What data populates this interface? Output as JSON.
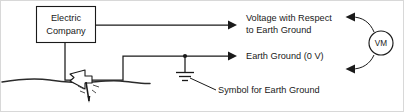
{
  "figure": {
    "source_box": {
      "line1": "Electric",
      "line2": "Company"
    },
    "labels": {
      "voltage_line1": "Voltage with Respect",
      "voltage_line2": "to Earth Ground",
      "earth_ground": "Earth Ground (0 V)",
      "symbol_caption": "Symbol for Earth Ground"
    },
    "meter": {
      "label": "VM"
    },
    "colors": {
      "ink": "#1a1a1a",
      "terrain": "#2b2b2b",
      "frame": "#d8d8d8",
      "background": "#ffffff"
    }
  }
}
